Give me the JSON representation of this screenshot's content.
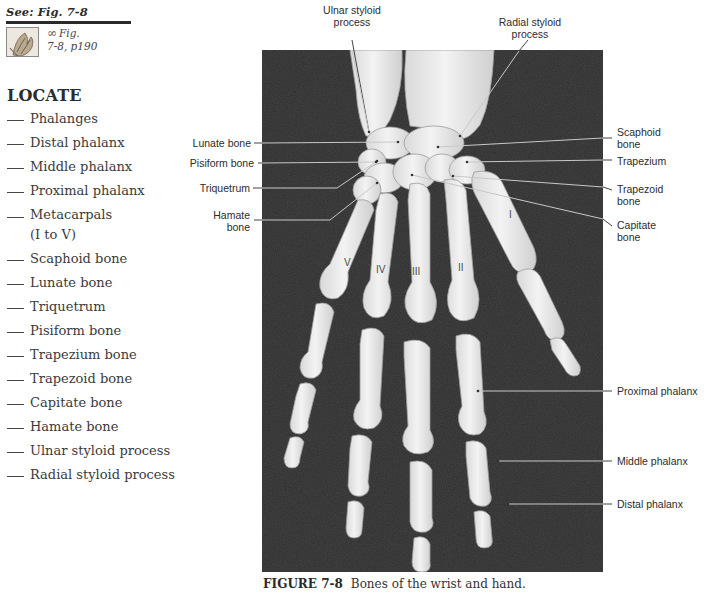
{
  "see_fig": {
    "title": "See: Fig. 7-8",
    "link_glyph": "∞",
    "ref_line1": "Fig.",
    "ref_line2": "7-8, p190",
    "thumbnail_icon": "anatomy-thumbnail"
  },
  "locate": {
    "title": "LOCATE",
    "items": [
      {
        "label": "Phalanges"
      },
      {
        "label": "Distal phalanx"
      },
      {
        "label": "Middle phalanx"
      },
      {
        "label": "Proximal phalanx"
      },
      {
        "label": "Metacarpals",
        "label2": "(I to V)"
      },
      {
        "label": "Scaphoid bone"
      },
      {
        "label": "Lunate bone"
      },
      {
        "label": "Triquetrum"
      },
      {
        "label": "Pisiform bone"
      },
      {
        "label": "Trapezium bone"
      },
      {
        "label": "Trapezoid bone"
      },
      {
        "label": "Capitate bone"
      },
      {
        "label": "Hamate bone"
      },
      {
        "label": "Ulnar styloid process"
      },
      {
        "label": "Radial styloid process"
      }
    ]
  },
  "figure": {
    "labels": {
      "ulnar_styloid": {
        "line1": "Ulnar styloid",
        "line2": "process"
      },
      "radial_styloid": {
        "line1": "Radial styloid",
        "line2": "process"
      },
      "lunate": "Lunate bone",
      "pisiform": "Pisiform bone",
      "triquetrum": "Triquetrum",
      "hamate": {
        "line1": "Hamate",
        "line2": "bone"
      },
      "scaphoid": {
        "line1": "Scaphoid",
        "line2": "bone"
      },
      "trapezium": "Trapezium",
      "trapezoid": {
        "line1": "Trapezoid",
        "line2": "bone"
      },
      "capitate": {
        "line1": "Capitate",
        "line2": "bone"
      },
      "proximal_phalanx": "Proximal phalanx",
      "middle_phalanx": "Middle phalanx",
      "distal_phalanx": "Distal phalanx"
    },
    "numerals": {
      "I": "I",
      "II": "II",
      "III": "III",
      "IV": "IV",
      "V": "V"
    },
    "caption_label": "FIGURE 7-8",
    "caption_text": "Bones of the wrist and hand."
  }
}
